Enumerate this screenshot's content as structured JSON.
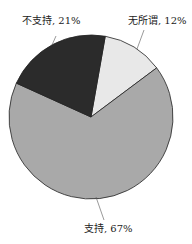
{
  "chart_data": {
    "type": "pie",
    "title": "",
    "categories": [
      "无所谓",
      "支持",
      "不支持"
    ],
    "values": [
      12,
      67,
      21
    ],
    "unit": "%",
    "colors": [
      "#e8e8e8",
      "#a9a9a9",
      "#2b2b2b"
    ],
    "labels": {
      "neutral": "无所谓, 12%",
      "support": "支持, 67%",
      "oppose": "不支持, 21%"
    },
    "legend": "none (data labels with leader lines)"
  }
}
